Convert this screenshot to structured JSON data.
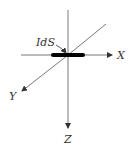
{
  "diagram": {
    "type": "3d-coordinate-axes",
    "element_label": "IdS",
    "axes": {
      "x": "X",
      "y": "Y",
      "z": "Z"
    },
    "colors": {
      "line": "#444444",
      "element": "#000000",
      "text": "#333333"
    }
  }
}
